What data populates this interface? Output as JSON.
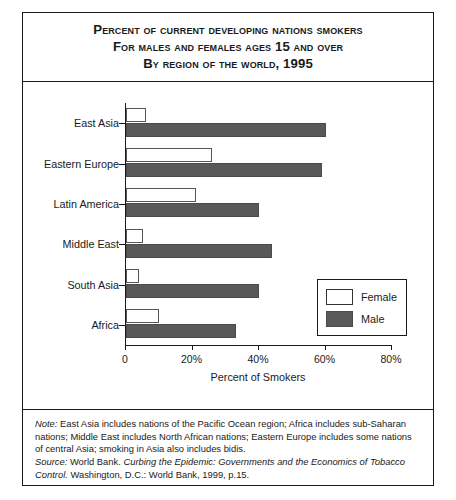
{
  "title": {
    "line1": "Percent of Current Developing Nations Smokers",
    "line2": "for Males and Females Ages 15 and Over",
    "line3": "by Region of the World, 1995"
  },
  "legend": {
    "female_label": "Female",
    "male_label": "Male",
    "female_color": "#ffffff",
    "male_color": "#595959"
  },
  "notes": {
    "note_lead": "Note:",
    "note_body": " East Asia includes nations of the Pacific Ocean region; Africa includes sub-Saharan nations; Middle East includes North African nations; Eastern Europe includes some nations of central Asia; smoking in Asia also includes bidis.",
    "source_lead": "Source:",
    "source_pre": " World Bank. ",
    "source_work": "Curbing the Epidemic: Governments and the Economics of Tobacco Control.",
    "source_post": " Washington, D.C.: World Bank, 1999, p.15."
  },
  "chart_data": {
    "type": "bar",
    "orientation": "horizontal",
    "title": "Percent of Current Developing Nations Smokers for Males and Females Ages 15 and Over by Region of the World, 1995",
    "xlabel": "Percent of Smokers",
    "ylabel": "",
    "xlim": [
      0,
      80
    ],
    "xticks": [
      0,
      20,
      40,
      60,
      80
    ],
    "xticklabels": [
      "0",
      "20%",
      "40%",
      "60%",
      "80%"
    ],
    "grid": false,
    "legend_position": "lower-right-inside",
    "categories": [
      "East Asia",
      "Eastern Europe",
      "Latin America",
      "Middle East",
      "South Asia",
      "Africa"
    ],
    "series": [
      {
        "name": "Female",
        "values": [
          6,
          26,
          21,
          5,
          4,
          10
        ]
      },
      {
        "name": "Male",
        "values": [
          60,
          59,
          40,
          44,
          40,
          33
        ]
      }
    ]
  }
}
